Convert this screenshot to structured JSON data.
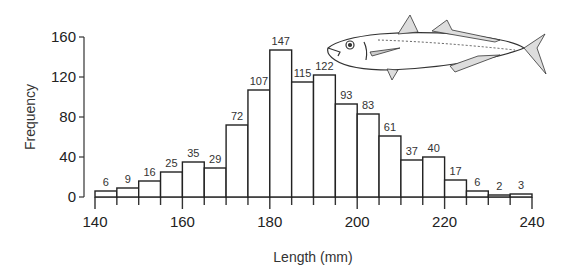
{
  "chart_data": {
    "type": "bar",
    "subtype": "histogram",
    "title": "",
    "xlabel": "Length (mm)",
    "ylabel": "Frequency",
    "bin_width": 5,
    "bin_edges": [
      140,
      145,
      150,
      155,
      160,
      165,
      170,
      175,
      180,
      185,
      190,
      195,
      200,
      205,
      210,
      215,
      220,
      225,
      230,
      235,
      240
    ],
    "categories": [
      "140-145",
      "145-150",
      "150-155",
      "155-160",
      "160-165",
      "165-170",
      "170-175",
      "175-180",
      "180-185",
      "185-190",
      "190-195",
      "195-200",
      "200-205",
      "205-210",
      "210-215",
      "215-220",
      "220-225",
      "225-230",
      "230-235",
      "235-240"
    ],
    "values": [
      6,
      9,
      16,
      25,
      35,
      29,
      72,
      107,
      147,
      115,
      122,
      93,
      83,
      61,
      37,
      40,
      17,
      6,
      2,
      3
    ],
    "xlim": [
      140,
      240
    ],
    "ylim": [
      0,
      160
    ],
    "x_ticks": [
      140,
      160,
      180,
      200,
      220,
      240
    ],
    "y_ticks": [
      0,
      40,
      80,
      120,
      160
    ],
    "grid": false,
    "legend": null,
    "annotations": [
      "fish-illustration (mackerel/scad) top-right"
    ]
  },
  "colors": {
    "bar_fill": "#ffffff",
    "bar_stroke": "#222222",
    "axis": "#333333",
    "text": "#222222"
  }
}
